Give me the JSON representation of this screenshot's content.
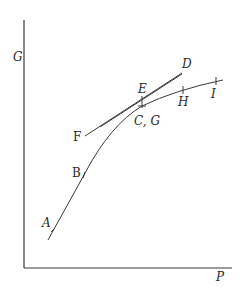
{
  "diagram": {
    "axes": {
      "y_label": "G",
      "x_label": "P"
    },
    "points": {
      "A": "A",
      "B": "B",
      "CG": "C, G",
      "D": "D",
      "E": "E",
      "F": "F",
      "H": "H",
      "I": "I"
    },
    "colors": {
      "line": "#3a3a3a",
      "text": "#2a2a2a",
      "background": "#ffffff"
    }
  }
}
